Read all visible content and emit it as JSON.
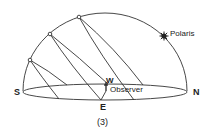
{
  "figure": {
    "caption": "(3)",
    "labels": {
      "south": "S",
      "north": "N",
      "east": "E",
      "west": "W",
      "observer": "Observer",
      "polaris": "Polaris"
    },
    "sun_paths": [
      {
        "name": "low-path",
        "dot": [
          30,
          60
        ]
      },
      {
        "name": "mid-path",
        "dot": [
          50,
          34
        ]
      },
      {
        "name": "high-path",
        "dot": [
          79,
          17
        ]
      }
    ],
    "colors": {
      "line": "#333333",
      "text": "#222222",
      "background": "#ffffff"
    }
  }
}
